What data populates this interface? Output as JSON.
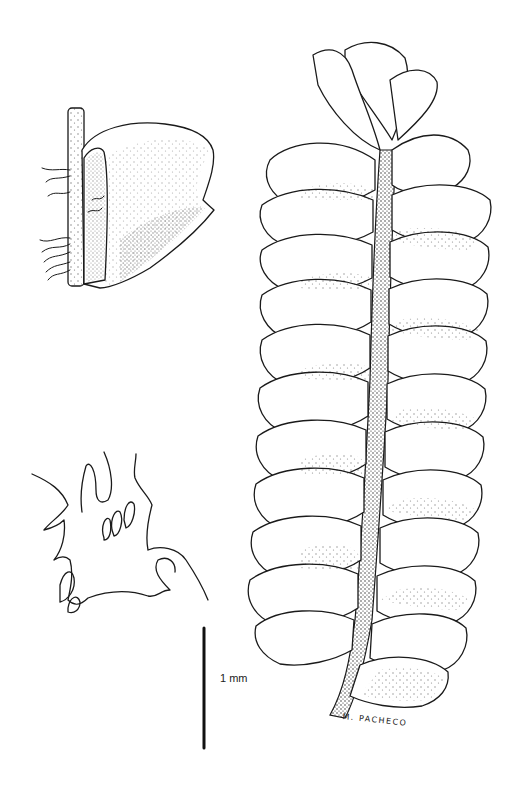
{
  "figure": {
    "panels": [
      {
        "name": "leaf-with-stem",
        "description": "Single leaf attached to stem section with rhizoids"
      },
      {
        "name": "underleaf",
        "description": "Outline of underleaf with lobes and cilia"
      },
      {
        "name": "shoot",
        "description": "Shoot in ventral/dorsal view with overlapping leaves"
      }
    ],
    "scale_bar": {
      "label": "1 mm"
    },
    "signature": "M. PACHECO",
    "colors": {
      "ink": "#1a1a1a",
      "background": "#ffffff"
    }
  }
}
